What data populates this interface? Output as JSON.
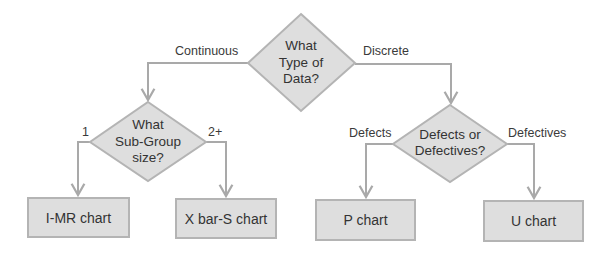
{
  "colors": {
    "node_fill": "#dedede",
    "node_border": "#b4b4b4",
    "connector": "#a9a9a9",
    "text": "#333333"
  },
  "decisions": {
    "root": {
      "line1": "What",
      "line2": "Type of",
      "line3": "Data?"
    },
    "subgroup": {
      "line1": "What",
      "line2": "Sub-Group",
      "line3": "size?"
    },
    "defects": {
      "line1": "Defects or",
      "line2": "Defectives?"
    }
  },
  "edges": {
    "continuous": "Continuous",
    "discrete": "Discrete",
    "one": "1",
    "two_plus": "2+",
    "defects": "Defects",
    "defectives": "Defectives"
  },
  "outcomes": {
    "imr": "I-MR chart",
    "xbar_s": "X bar-S chart",
    "p": "P chart",
    "u": "U chart"
  }
}
